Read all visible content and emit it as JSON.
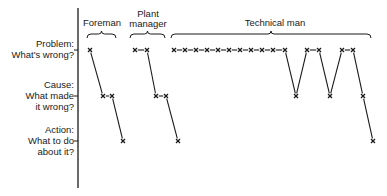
{
  "rows": [
    {
      "key": "problem",
      "line1": "Problem:",
      "line2": "What's wrong?",
      "y": 50
    },
    {
      "key": "cause",
      "line1": "Cause:",
      "line2": "What made",
      "line3": "it wrong?",
      "y": 96
    },
    {
      "key": "action",
      "line1": "Action:",
      "line2": "What to do",
      "line3": "about it?",
      "y": 141
    }
  ],
  "groups": [
    {
      "key": "foreman",
      "label": "Foreman",
      "x1": 87,
      "x2": 116
    },
    {
      "key": "plant_manager",
      "label_line1": "Plant",
      "label_line2": "manager",
      "x1": 130,
      "x2": 165
    },
    {
      "key": "technical_man",
      "label": "Technical man",
      "x1": 171,
      "x2": 371
    }
  ],
  "paths": [
    {
      "group": "foreman",
      "points": [
        [
          90,
          50
        ],
        [
          103,
          96
        ],
        [
          112,
          96
        ],
        [
          123,
          141
        ]
      ]
    },
    {
      "group": "plant_manager",
      "points": [
        [
          135,
          50
        ],
        [
          147,
          50
        ],
        [
          156,
          96
        ],
        [
          166,
          96
        ],
        [
          178,
          141
        ]
      ]
    },
    {
      "group": "technical_man",
      "points": [
        [
          174,
          50
        ],
        [
          185,
          50
        ],
        [
          196,
          50
        ],
        [
          207,
          50
        ],
        [
          218,
          50
        ],
        [
          229,
          50
        ],
        [
          240,
          50
        ],
        [
          251,
          50
        ],
        [
          262,
          50
        ],
        [
          273,
          50
        ],
        [
          285,
          50
        ],
        [
          296,
          96
        ],
        [
          307,
          50
        ],
        [
          319,
          50
        ],
        [
          330,
          96
        ],
        [
          342,
          50
        ],
        [
          353,
          50
        ],
        [
          363,
          96
        ],
        [
          373,
          141
        ]
      ]
    }
  ],
  "marker_glyph": "×",
  "colors": {
    "ink": "#1a1a1a",
    "background": "#ffffff"
  }
}
